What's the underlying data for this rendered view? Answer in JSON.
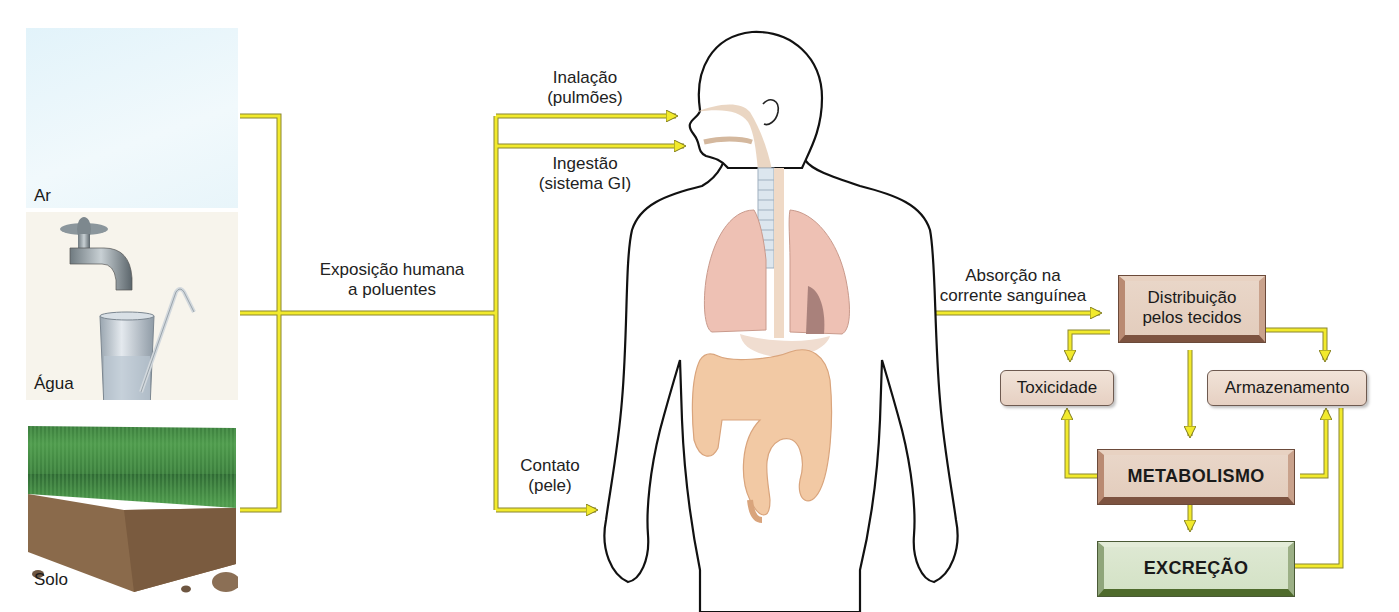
{
  "title": "Exposição humana a poluentes",
  "sources": [
    {
      "id": "air",
      "label": "Ar"
    },
    {
      "id": "water",
      "label": "Água"
    },
    {
      "id": "soil",
      "label": "Solo"
    }
  ],
  "exposure_label": {
    "line1": "Exposição humana",
    "line2": "a poluentes"
  },
  "routes": [
    {
      "id": "inhalation",
      "line1": "Inalação",
      "line2": "(pulmões)"
    },
    {
      "id": "ingestion",
      "line1": "Ingestão",
      "line2": "(sistema GI)"
    },
    {
      "id": "contact",
      "line1": "Contato",
      "line2": "(pele)"
    }
  ],
  "absorption_label": {
    "line1": "Absorção na",
    "line2": "corrente sanguínea"
  },
  "boxes": {
    "distribution": {
      "line1": "Distribuição",
      "line2": "pelos tecidos"
    },
    "toxicity": "Toxicidade",
    "storage": "Armazenamento",
    "metabolism": "METABOLISMO",
    "excretion": "EXCREÇÃO"
  },
  "colors": {
    "arrow_yellow": "#f2ea2c",
    "arrow_outline": "#8a8a2a",
    "brown_box": "#e6d0c2",
    "green_box": "#d8e5cc",
    "sky": "#eaf6fb",
    "organ_pink": "#eec1b4",
    "intestine": "#f2c9a4"
  }
}
